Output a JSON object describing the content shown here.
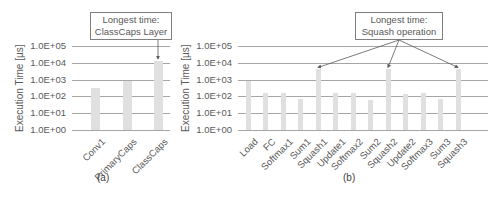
{
  "chart_data": [
    {
      "type": "bar",
      "panel": "(a)",
      "title": "",
      "xlabel": "",
      "ylabel": "Execution Time [µs]",
      "yscale": "log",
      "ylim": [
        1,
        100000
      ],
      "yticks": [
        "1.0E+00",
        "1.0E+01",
        "1.0E+02",
        "1.0E+03",
        "1.0E+04",
        "1.0E+05"
      ],
      "grid": true,
      "categories": [
        "Conv1",
        "PrimaryCaps",
        "ClassCaps"
      ],
      "values": [
        300,
        800,
        13000
      ],
      "annotations": [
        {
          "text_line1": "Longest time:",
          "text_line2": "ClassCaps Layer",
          "target": "ClassCaps"
        }
      ]
    },
    {
      "type": "bar",
      "panel": "(b)",
      "title": "",
      "xlabel": "",
      "ylabel": "Execution Time [µs]",
      "yscale": "log",
      "ylim": [
        1,
        100000
      ],
      "yticks": [
        "1.0E+00",
        "1.0E+01",
        "1.0E+02",
        "1.0E+03",
        "1.0E+04",
        "1.0E+05"
      ],
      "grid": true,
      "categories": [
        "Load",
        "FC",
        "Softmax1",
        "Sum1",
        "Squash1",
        "Update1",
        "Softmax2",
        "Sum2",
        "Squash2",
        "Update2",
        "Softmax3",
        "Sum3",
        "Squash3"
      ],
      "values": [
        800,
        150,
        150,
        70,
        4000,
        150,
        150,
        60,
        4000,
        130,
        150,
        70,
        4000
      ],
      "annotations": [
        {
          "text_line1": "Longest time:",
          "text_line2": "Squash operation",
          "target": [
            "Squash1",
            "Squash2",
            "Squash3"
          ]
        }
      ]
    }
  ],
  "colors": {
    "bar": "#e0e0e0",
    "grid": "#a6a6a6",
    "text": "#595959",
    "arrow": "#595959"
  }
}
